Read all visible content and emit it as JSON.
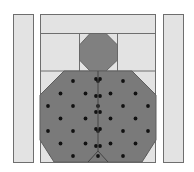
{
  "diagram": {
    "type": "quilt-block",
    "colors": {
      "background": "#ffffff",
      "light_fabric": "#e3e3e3",
      "body_fabric": "#7a7a7a",
      "head_fabric": "#808080",
      "dots": "#111111",
      "seam": "#6e6e6e"
    },
    "pieces": [
      {
        "name": "left-sashing-strip"
      },
      {
        "name": "top-band"
      },
      {
        "name": "head-octagon"
      },
      {
        "name": "body-octagon"
      },
      {
        "name": "right-sashing-strip"
      }
    ]
  }
}
